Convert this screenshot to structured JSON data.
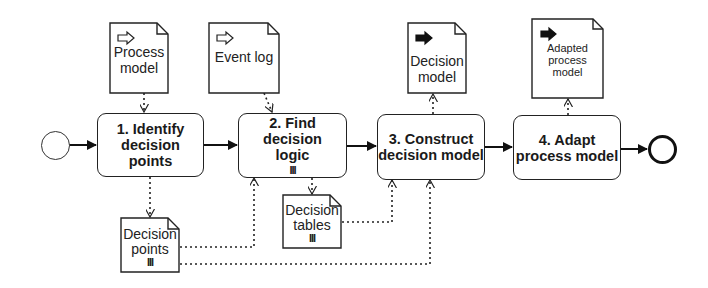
{
  "diagram": {
    "type": "BPMN process",
    "events": {
      "start": {
        "label": ""
      },
      "end": {
        "label": ""
      }
    },
    "tasks": [
      {
        "id": "t1",
        "number": "1.",
        "line1": "1. Identify",
        "line2": "decision points",
        "marker": ""
      },
      {
        "id": "t2",
        "number": "2.",
        "line1": "2. Find decision",
        "line2": "logic",
        "marker": "III"
      },
      {
        "id": "t3",
        "number": "3.",
        "line1": "3. Construct",
        "line2": "decision model",
        "marker": ""
      },
      {
        "id": "t4",
        "number": "4.",
        "line1": "4. Adapt",
        "line2": "process model",
        "marker": ""
      }
    ],
    "data_objects": [
      {
        "id": "process_model",
        "line1": "Process",
        "line2": "model",
        "line3": "",
        "kind": "input",
        "icon": "input-arrow-icon"
      },
      {
        "id": "event_log",
        "line1": "Event log",
        "line2": "",
        "line3": "",
        "kind": "input",
        "icon": "input-arrow-icon"
      },
      {
        "id": "decision_model",
        "line1": "Decision",
        "line2": "model",
        "line3": "",
        "kind": "output",
        "icon": "output-arrow-icon"
      },
      {
        "id": "adapted_process_model",
        "line1": "Adapted",
        "line2": "process",
        "line3": "model",
        "kind": "output",
        "icon": "output-arrow-icon"
      },
      {
        "id": "decision_points",
        "line1": "Decision",
        "line2": "points",
        "marker": "III",
        "kind": "collection"
      },
      {
        "id": "decision_tables",
        "line1": "Decision",
        "line2": "tables",
        "marker": "III",
        "kind": "collection"
      }
    ],
    "sequence_flows": [
      {
        "from": "start",
        "to": "t1"
      },
      {
        "from": "t1",
        "to": "t2"
      },
      {
        "from": "t2",
        "to": "t3"
      },
      {
        "from": "t3",
        "to": "t4"
      },
      {
        "from": "t4",
        "to": "end"
      }
    ],
    "data_associations": [
      {
        "from": "process_model",
        "to": "t1"
      },
      {
        "from": "event_log",
        "to": "t2"
      },
      {
        "from": "t3",
        "to": "decision_model"
      },
      {
        "from": "t4",
        "to": "adapted_process_model"
      },
      {
        "from": "t1",
        "to": "decision_points"
      },
      {
        "from": "decision_points",
        "to": "t2"
      },
      {
        "from": "decision_points",
        "to": "t3"
      },
      {
        "from": "t2",
        "to": "decision_tables"
      },
      {
        "from": "decision_tables",
        "to": "t3"
      }
    ],
    "colors": {
      "stroke": "#222222",
      "background": "#ffffff"
    }
  }
}
